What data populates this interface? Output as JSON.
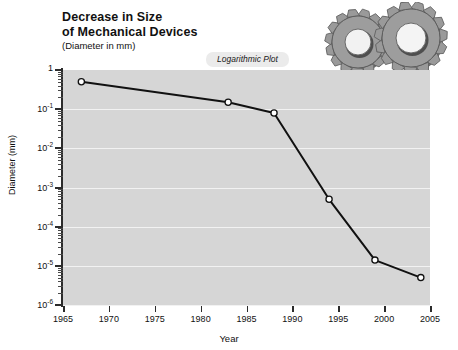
{
  "title": {
    "line1": "Decrease in Size",
    "line2": "of Mechanical Devices",
    "subtitle": "(Diameter in mm)"
  },
  "badge": {
    "label": "Logarithmic Plot"
  },
  "decoration": {
    "gears_icon": "gears-icon",
    "gear_color": "#8e8e8e",
    "gear_shadow": "#5a5a5a"
  },
  "chart_data": {
    "type": "line",
    "title": "Decrease in Size of Mechanical Devices",
    "subtitle": "(Diameter in mm)",
    "annotations": [
      "Logarithmic Plot"
    ],
    "xlabel": "Year",
    "ylabel": "Diameter (mm)",
    "xlim": [
      1965,
      2005
    ],
    "ylim": [
      1e-06,
      1
    ],
    "yscale": "log",
    "xscale": "linear",
    "grid": true,
    "legend": false,
    "plot_bgcolor": "#d6d6d6",
    "gridline_color": "#f2f2f2",
    "line_color": "#111111",
    "marker_facecolor": "#ffffff",
    "marker_edgecolor": "#111111",
    "xticks": [
      1965,
      1970,
      1975,
      1980,
      1985,
      1990,
      1995,
      2000,
      2005
    ],
    "xticklabels": [
      "1965",
      "1970",
      "1975",
      "1980",
      "1985",
      "1990",
      "1995",
      "2000",
      "2005"
    ],
    "yticks": [
      1,
      0.1,
      0.01,
      0.001,
      0.0001,
      1e-05,
      1e-06
    ],
    "yticklabels": [
      "1",
      "10-1",
      "10-2",
      "10-3",
      "10-4",
      "10-5",
      "10-6"
    ],
    "yticklabels_display": [
      {
        "mantissa": "1",
        "exponent": ""
      },
      {
        "mantissa": "10",
        "exponent": "-1"
      },
      {
        "mantissa": "10",
        "exponent": "-2"
      },
      {
        "mantissa": "10",
        "exponent": "-3"
      },
      {
        "mantissa": "10",
        "exponent": "-4"
      },
      {
        "mantissa": "10",
        "exponent": "-5"
      },
      {
        "mantissa": "10",
        "exponent": "-6"
      }
    ],
    "x": [
      1967,
      1983,
      1988,
      1994,
      1999,
      2004
    ],
    "y": [
      0.5,
      0.15,
      0.08,
      0.0005,
      1.4e-05,
      5e-06
    ],
    "series": [
      {
        "name": "Diameter of mechanical devices",
        "points": [
          {
            "x": 1967,
            "y": 0.5
          },
          {
            "x": 1983,
            "y": 0.15
          },
          {
            "x": 1988,
            "y": 0.08
          },
          {
            "x": 1994,
            "y": 0.0005
          },
          {
            "x": 1999,
            "y": 1.4e-05
          },
          {
            "x": 2004,
            "y": 5e-06
          }
        ]
      }
    ]
  }
}
